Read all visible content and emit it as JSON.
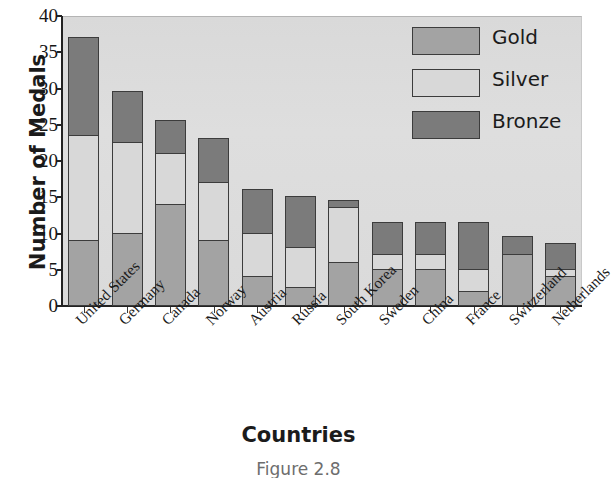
{
  "chart_data": {
    "type": "bar",
    "subtype": "stacked-bar",
    "title": "",
    "xlabel": "Countries",
    "ylabel": "Number of Medals",
    "ylim": [
      0,
      40
    ],
    "yticks": [
      0,
      5,
      10,
      15,
      20,
      25,
      30,
      35,
      40
    ],
    "ytick_labels": [
      "0",
      "5",
      "10",
      "15",
      "20",
      "25",
      "30",
      "35",
      "40"
    ],
    "grid": false,
    "legend_position": "upper-right-inside",
    "categories": [
      "United States",
      "Germany",
      "Canada",
      "Norway",
      "Austria",
      "Russia",
      "South Korea",
      "Sweden",
      "China",
      "France",
      "Switzerland",
      "Netherlands"
    ],
    "series": [
      {
        "name": "Gold",
        "color": "#a3a3a3",
        "values": [
          9,
          10,
          14,
          9,
          4,
          2.5,
          6,
          5,
          5,
          2,
          7,
          4
        ]
      },
      {
        "name": "Silver",
        "color": "#d8d8d8",
        "values": [
          14.5,
          12.5,
          7,
          8,
          6,
          5.5,
          7.5,
          2,
          2,
          3,
          0,
          1
        ]
      },
      {
        "name": "Bronze",
        "color": "#7b7b7b",
        "values": [
          13.5,
          7,
          4.5,
          6,
          6,
          7,
          1,
          4.5,
          4.5,
          6.5,
          2.5,
          3.5
        ]
      }
    ],
    "totals": [
      37,
      29.5,
      25.5,
      23,
      16,
      15,
      14.5,
      11.5,
      11.5,
      11.5,
      9.5,
      8.5
    ]
  },
  "axes": {
    "ylabel": "Number of Medals",
    "xlabel": "Countries"
  },
  "legend": {
    "items": [
      {
        "label": "Gold",
        "color": "#a3a3a3"
      },
      {
        "label": "Silver",
        "color": "#d8d8d8"
      },
      {
        "label": "Bronze",
        "color": "#7b7b7b"
      }
    ]
  },
  "caption": "Figure 2.8",
  "colors": {
    "plot_background": "#dcdcdc",
    "axis": "#222222",
    "page_background": "#ffffff"
  }
}
